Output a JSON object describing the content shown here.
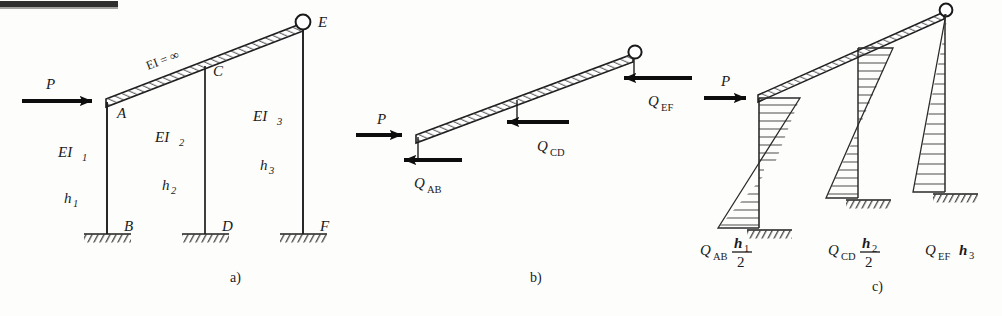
{
  "figure": {
    "type": "structural-engineering-diagram",
    "ink_color": "#1d1d1d",
    "background_color": "#fdfdfc"
  },
  "panels": [
    {
      "id": "a",
      "label": "a)",
      "caption_x": 230,
      "caption_y": 282,
      "description": "Frame geometry with rigid beam EI = infinity, three fixed-base columns and a hinge at E",
      "beam_label": "EI = ∞",
      "load_label": "P",
      "nodes": [
        {
          "name": "A",
          "label": "A",
          "x": 107,
          "y": 102,
          "label_x": 117,
          "label_y": 118,
          "support": "beam-column-joint"
        },
        {
          "name": "B",
          "label": "B",
          "x": 107,
          "y": 233,
          "label_x": 124,
          "label_y": 231,
          "support": "fixed"
        },
        {
          "name": "C",
          "label": "C",
          "x": 205,
          "y": 68,
          "label_x": 213,
          "label_y": 76,
          "support": "beam-column-joint"
        },
        {
          "name": "D",
          "label": "D",
          "x": 205,
          "y": 233,
          "label_x": 222,
          "label_y": 231,
          "support": "fixed"
        },
        {
          "name": "E",
          "label": "E",
          "x": 303,
          "y": 23,
          "label_x": 318,
          "label_y": 27,
          "support": "hinge"
        },
        {
          "name": "F",
          "label": "F",
          "x": 303,
          "y": 233,
          "label_x": 320,
          "label_y": 231,
          "support": "fixed"
        }
      ],
      "columns": [
        {
          "name": "AB",
          "stiffness_label": "EI",
          "stiffness_sub": "1",
          "height_label": "h",
          "height_sub": "1",
          "stiffness_x": 58,
          "stiffness_y": 157,
          "height_x": 62,
          "height_y": 203
        },
        {
          "name": "CD",
          "stiffness_label": "EI",
          "stiffness_sub": "2",
          "height_label": "h",
          "height_sub": "2",
          "stiffness_x": 155,
          "stiffness_y": 142,
          "height_x": 160,
          "height_y": 190
        },
        {
          "name": "EF",
          "stiffness_label": "EI",
          "stiffness_sub": "3",
          "height_label": "h",
          "height_sub": "3",
          "stiffness_x": 253,
          "stiffness_y": 121,
          "height_x": 258,
          "height_y": 170
        }
      ]
    },
    {
      "id": "b",
      "label": "b)",
      "caption_x": 530,
      "caption_y": 282,
      "description": "Free body diagram of the rigid beam with applied load P and column shear reactions",
      "forces": [
        {
          "name": "P",
          "label": "P",
          "sub": "",
          "direction": "right",
          "label_x": 381,
          "label_y": 119
        },
        {
          "name": "Q_AB",
          "label": "Q",
          "sub": "AB",
          "direction": "left",
          "label_x": 415,
          "label_y": 201
        },
        {
          "name": "Q_CD",
          "label": "Q",
          "sub": "CD",
          "direction": "left",
          "label_x": 543,
          "label_y": 156
        },
        {
          "name": "Q_EF",
          "label": "Q",
          "sub": "EF",
          "direction": "left",
          "label_x": 652,
          "label_y": 113
        }
      ]
    },
    {
      "id": "c",
      "label": "c)",
      "caption_x": 872,
      "caption_y": 291,
      "description": "Bending moment diagrams on the three columns",
      "load_label": "P",
      "diagrams": [
        {
          "name": "AB",
          "shape": "bow-tie",
          "label_q": "Q",
          "label_sub": "AB",
          "numer": "h",
          "numer_sub": "1",
          "denom": "2",
          "label_x": 702,
          "label_y": 249,
          "axis_x": 759,
          "top_y": 98,
          "base_y": 228
        },
        {
          "name": "CD",
          "shape": "bow-tie",
          "label_q": "Q",
          "label_sub": "CD",
          "numer": "h",
          "numer_sub": "2",
          "denom": "2",
          "label_x": 830,
          "label_y": 249,
          "axis_x": 858,
          "top_y": 48,
          "base_y": 198
        },
        {
          "name": "EF",
          "shape": "triangle",
          "label_q": "Q",
          "label_sub": "EF",
          "numer": "h",
          "numer_sub": "3",
          "denom": "",
          "label_x": 928,
          "label_y": 249,
          "axis_x": 945,
          "top_y": 10,
          "base_y": 192
        }
      ]
    }
  ],
  "symbols": {
    "infinity": "∞",
    "equals": "=",
    "ei": "EI"
  }
}
